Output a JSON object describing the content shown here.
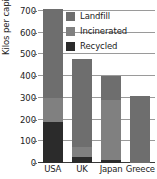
{
  "chart_data": {
    "type": "bar",
    "subtype": "stacked",
    "title": "",
    "xlabel": "",
    "ylabel": "Kilos per capita",
    "ylim": [
      0,
      700
    ],
    "yticks": [
      0,
      100,
      200,
      300,
      400,
      500,
      600,
      700
    ],
    "ytick_labels": [
      "0",
      "100",
      "200",
      "300",
      "400",
      "500",
      "600",
      "700"
    ],
    "categories": [
      "USA",
      "UK",
      "Japan",
      "Greece"
    ],
    "grid": true,
    "grid_axis": "y",
    "legend_position": "top-right",
    "stack_order_bottom_to_top": [
      "Recycled",
      "Incinerated",
      "Landfill"
    ],
    "series": [
      {
        "name": "Recycled",
        "color": "#2b2b2b",
        "values": [
          190,
          30,
          15,
          0
        ]
      },
      {
        "name": "Incinerated",
        "color": "#808080",
        "values": [
          110,
          45,
          275,
          0
        ]
      },
      {
        "name": "Landfill",
        "color": "#6e6e6e",
        "values": [
          410,
          405,
          110,
          310
        ]
      }
    ],
    "totals": [
      710,
      480,
      400,
      310
    ],
    "legend": [
      {
        "label": "Landfill",
        "color": "#6e6e6e"
      },
      {
        "label": "Incinerated",
        "color": "#808080"
      },
      {
        "label": "Recycled",
        "color": "#2b2b2b"
      }
    ]
  },
  "colors": {
    "background": "#ffffff",
    "gridline": "#9a9a9a",
    "axis": "#3a3a3a",
    "text": "#232323",
    "landfill": "#6e6e6e",
    "incinerated": "#808080",
    "recycled": "#2b2b2b"
  }
}
